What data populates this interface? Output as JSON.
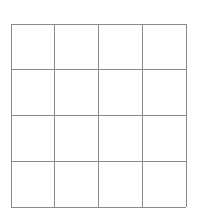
{
  "grid": {
    "rows": 4,
    "cols": 4,
    "left": 11,
    "top": 24,
    "right": 186,
    "bottom": 207,
    "x_lines": [
      11,
      54,
      98,
      142,
      186
    ],
    "y_lines": [
      24,
      69,
      115,
      161,
      207
    ],
    "line_color": "#8a8a8a"
  }
}
